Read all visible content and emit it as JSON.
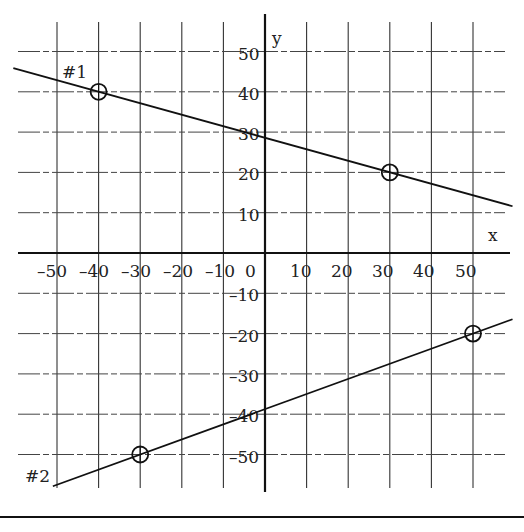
{
  "chart_data": {
    "type": "line",
    "title": "",
    "xlabel": "x",
    "ylabel": "y",
    "xlim": [
      -50,
      50
    ],
    "ylim": [
      -50,
      50
    ],
    "grid": true,
    "x_ticks": [
      -50,
      -40,
      -30,
      -20,
      -10,
      0,
      10,
      20,
      30,
      40,
      50
    ],
    "y_ticks": [
      50,
      40,
      30,
      20,
      10,
      -10,
      -20,
      -30,
      -40,
      -50
    ],
    "x_tick_labels": [
      "-50",
      "-40",
      "-30",
      "-20",
      "-10",
      "0",
      "10",
      "20",
      "30",
      "40",
      "50"
    ],
    "y_tick_labels": [
      "50",
      "40",
      "30",
      "20",
      "10",
      "-10",
      "-20",
      "-30",
      "-40",
      "-50"
    ],
    "series": [
      {
        "name": "#1",
        "marked_points": [
          [
            -40,
            40
          ],
          [
            30,
            20
          ]
        ],
        "y_intercept": 28.6,
        "slope": -0.2857
      },
      {
        "name": "#2",
        "marked_points": [
          [
            -30,
            -50
          ],
          [
            50,
            -20
          ]
        ],
        "y_intercept": -38.75,
        "slope": 0.375
      }
    ]
  },
  "labels": {
    "x_axis": "x",
    "y_axis": "y",
    "line1": "#1",
    "line2": "#2"
  }
}
